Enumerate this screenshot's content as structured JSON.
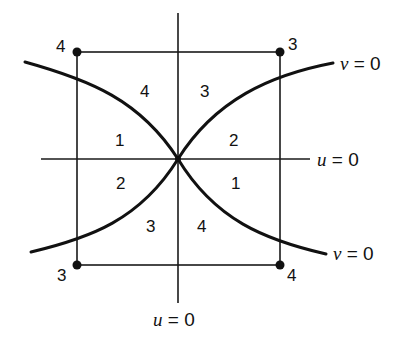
{
  "diagram": {
    "corner_labels": {
      "top_left": "4",
      "top_right": "3",
      "bottom_left": "3",
      "bottom_right": "4"
    },
    "region_labels": {
      "upper_left_outer": "4",
      "upper_right_outer": "3",
      "left_upper": "1",
      "right_upper": "2",
      "left_lower": "2",
      "right_lower": "1",
      "lower_left_outer": "3",
      "lower_right_outer": "4"
    },
    "curve_labels": {
      "v_top": {
        "var": "v",
        "eq": " = 0"
      },
      "v_bottom": {
        "var": "v",
        "eq": " = 0"
      },
      "u_horizontal": {
        "var": "u",
        "eq": " = 0"
      },
      "u_vertical": {
        "var": "u",
        "eq": " = 0"
      }
    },
    "colors": {
      "ink": "#111111",
      "background": "#ffffff"
    }
  }
}
